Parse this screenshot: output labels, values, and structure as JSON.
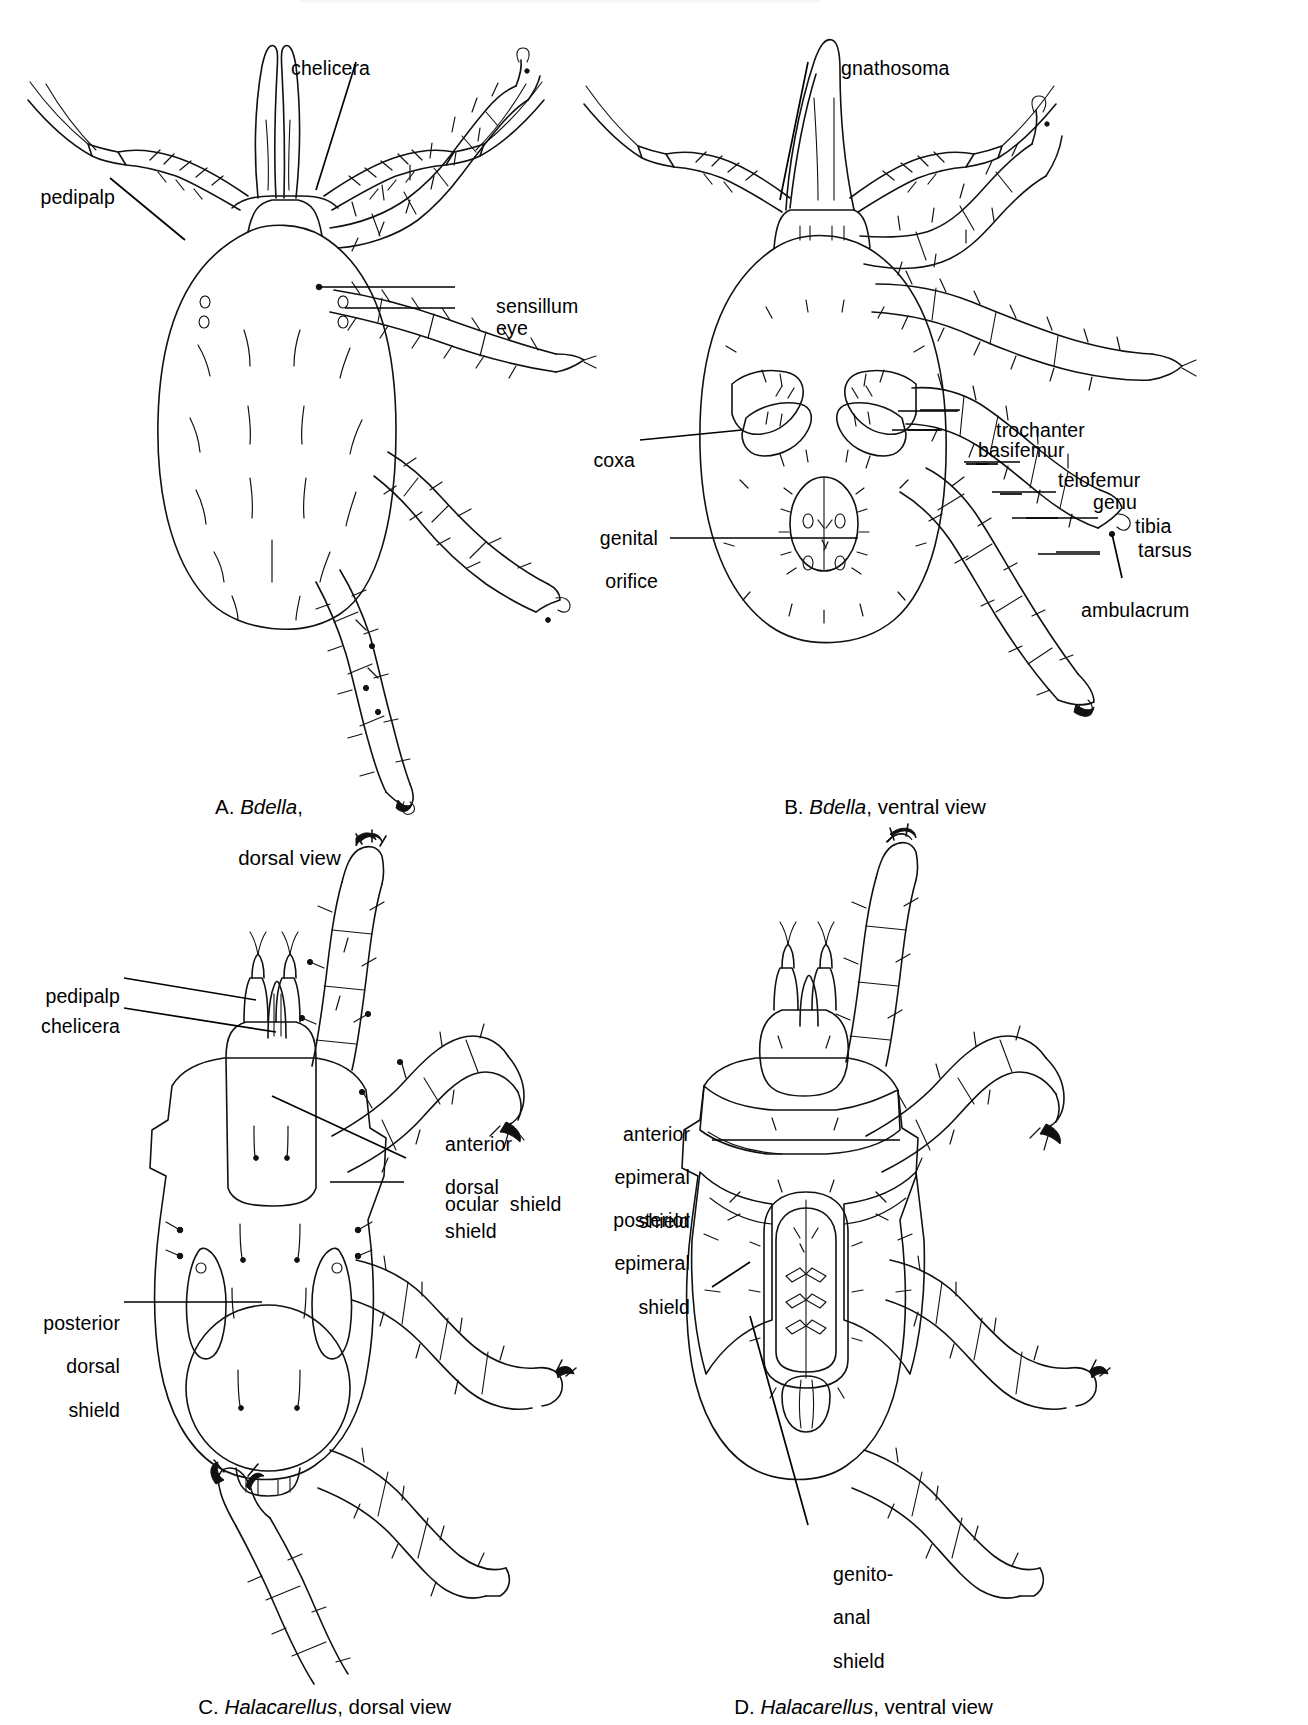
{
  "figure": {
    "panels": [
      {
        "id": "A",
        "letter": "A.",
        "taxon": "Bdella",
        "view": "dorsal view",
        "caption_line1": "A. Bdella,",
        "caption_line2": "dorsal view",
        "labels": [
          {
            "name": "chelicera",
            "text": "chelicera"
          },
          {
            "name": "pedipalp",
            "text": "pedipalp"
          },
          {
            "name": "sensillum",
            "text": "sensillum"
          },
          {
            "name": "eye",
            "text": "eye"
          }
        ]
      },
      {
        "id": "B",
        "letter": "B.",
        "taxon": "Bdella",
        "view": "ventral view",
        "caption_line1": "B. Bdella, ventral view",
        "labels": [
          {
            "name": "gnathosoma",
            "text": "gnathosoma"
          },
          {
            "name": "trochanter",
            "text": "trochanter"
          },
          {
            "name": "basifemur",
            "text": "basifemur"
          },
          {
            "name": "telofemur",
            "text": "telofemur"
          },
          {
            "name": "genu",
            "text": "genu"
          },
          {
            "name": "tibia",
            "text": "tibia"
          },
          {
            "name": "tarsus",
            "text": "tarsus"
          },
          {
            "name": "ambulacrum",
            "text": "ambulacrum"
          },
          {
            "name": "coxa",
            "text": "coxa"
          },
          {
            "name": "genital-orifice",
            "text": "genital\norifice"
          }
        ]
      },
      {
        "id": "C",
        "letter": "C.",
        "taxon": "Halacarellus",
        "view": "dorsal view",
        "caption_line1": "C. Halacarellus, dorsal view",
        "labels": [
          {
            "name": "pedipalp",
            "text": "pedipalp"
          },
          {
            "name": "chelicera",
            "text": "chelicera"
          },
          {
            "name": "anterior-dorsal-shield",
            "text": "anterior\ndorsal\nshield"
          },
          {
            "name": "ocular-shield",
            "text": "ocular  shield"
          },
          {
            "name": "posterior-dorsal-shield",
            "text": "posterior\ndorsal\nshield"
          }
        ]
      },
      {
        "id": "D",
        "letter": "D.",
        "taxon": "Halacarellus",
        "view": "ventral view",
        "caption_line1": "D. Halacarellus, ventral view",
        "labels": [
          {
            "name": "anterior-epimeral-shield",
            "text": "anterior\nepimeral\nshield"
          },
          {
            "name": "posterior-epimeral-shield",
            "text": "posterior\nepimeral\nshield"
          },
          {
            "name": "genito-anal-shield",
            "text": "genito-\nanal\nshield"
          }
        ]
      }
    ],
    "text": {
      "A_chelicera": "chelicera",
      "A_pedipalp": "pedipalp",
      "A_sensillum": "sensillum",
      "A_eye": "eye",
      "A_cap1": "A. ",
      "A_cap_taxon": "Bdella",
      "A_cap1b": ",",
      "A_cap2": "dorsal view",
      "B_gnathosoma": "gnathosoma",
      "B_trochanter": "trochanter",
      "B_basifemur": "basifemur",
      "B_telofemur": "telofemur",
      "B_genu": "genu",
      "B_tibia": "tibia",
      "B_tarsus": "tarsus",
      "B_ambulacrum": "ambulacrum",
      "B_coxa": "coxa",
      "B_genital1": "genital",
      "B_genital2": "orifice",
      "B_cap_pre": "B. ",
      "B_cap_taxon": "Bdella",
      "B_cap_post": ", ventral view",
      "C_pedipalp": "pedipalp",
      "C_chelicera": "chelicera",
      "C_ads1": "anterior",
      "C_ads2": "dorsal",
      "C_ads3": "shield",
      "C_ocular": "ocular  shield",
      "C_pds1": "posterior",
      "C_pds2": "dorsal",
      "C_pds3": "shield",
      "C_cap_pre": "C. ",
      "C_cap_taxon": "Halacarellus",
      "C_cap_post": ", dorsal view",
      "D_aes1": "anterior",
      "D_aes2": "epimeral",
      "D_aes3": "shield",
      "D_pes1": "posterior",
      "D_pes2": "epimeral",
      "D_pes3": "shield",
      "D_gas1": "genito-",
      "D_gas2": "anal",
      "D_gas3": "shield",
      "D_cap_pre": "D. ",
      "D_cap_taxon": "Halacarellus",
      "D_cap_post": ", ventral view"
    },
    "colors": {
      "ink": "#111111",
      "paper": "#ffffff"
    }
  }
}
